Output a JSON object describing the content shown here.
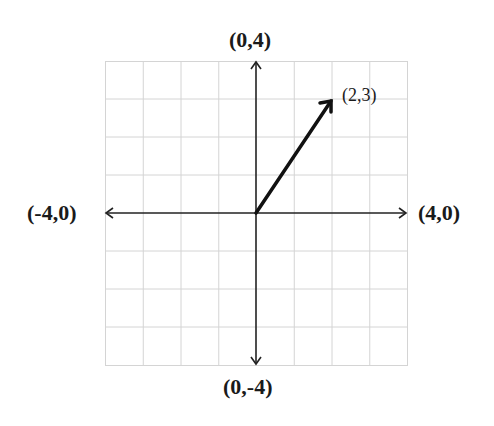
{
  "diagram": {
    "type": "coordinate-plane-vector",
    "grid": {
      "xmin": -4,
      "xmax": 4,
      "ymin": -4,
      "ymax": 4,
      "step": 1
    },
    "axis_labels": {
      "top": "(0,4)",
      "bottom": "(0,-4)",
      "left": "(-4,0)",
      "right": "(4,0)"
    },
    "vector": {
      "from": [
        0,
        0
      ],
      "to": [
        2,
        3
      ],
      "label": "(2,3)"
    },
    "colors": {
      "grid": "#d4d4d4",
      "axis": "#222222",
      "vector": "#111111"
    }
  }
}
